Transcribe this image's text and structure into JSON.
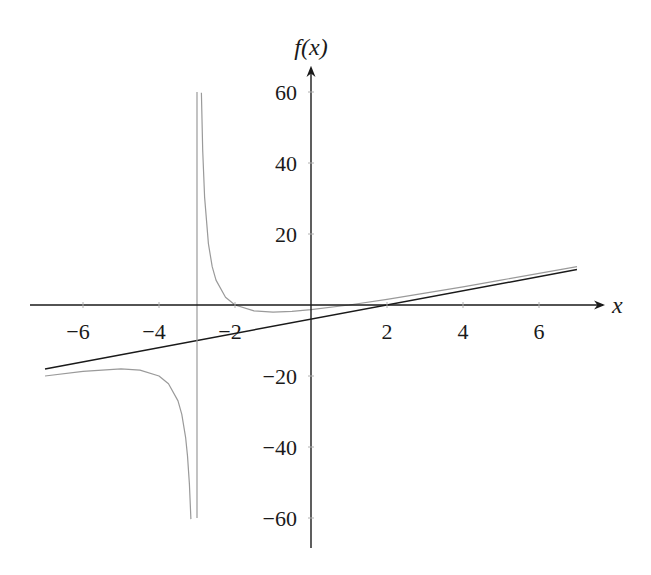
{
  "chart_data": {
    "type": "line",
    "title": "",
    "xlabel": "x",
    "ylabel": "f(x)",
    "xlim": [
      -7.5,
      7.8
    ],
    "ylim": [
      -68,
      67
    ],
    "x_ticks": [
      -6,
      -4,
      -2,
      2,
      4,
      6
    ],
    "x_tick_labels": [
      "−6",
      "−4",
      "−2",
      "2",
      "4",
      "6"
    ],
    "y_ticks": [
      60,
      40,
      20,
      -20,
      -40,
      -60
    ],
    "y_tick_labels": [
      "60",
      "40",
      "20",
      "−20",
      "−40",
      "−60"
    ],
    "grid": false,
    "legend": null,
    "series": [
      {
        "name": "f(x) = (2x^2 + 2x - 4)/(x + 3)",
        "color": "#9a9a9a",
        "branches": [
          {
            "x": [
              -7,
              -6,
              -5,
              -4.5,
              -4,
              -3.75,
              -3.5,
              -3.4,
              -3.3,
              -3.25,
              -3.2,
              -3.16
            ],
            "y": [
              -20,
              -18.67,
              -18,
              -18.33,
              -20,
              -22.17,
              -27,
              -30.8,
              -37.27,
              -42.5,
              -50.4,
              -60.3
            ]
          },
          {
            "x": [
              -2.885,
              -2.85,
              -2.8,
              -2.7,
              -2.6,
              -2.5,
              -2.25,
              -2,
              -1.5,
              -1,
              -0.5,
              0,
              1,
              2,
              3,
              4,
              5,
              6,
              7
            ],
            "y": [
              59.8,
              43.6,
              30.4,
              17.3,
              10.8,
              7,
              2.17,
              0,
              -1.67,
              -2,
              -1.8,
              -1.33,
              0,
              1.6,
              3.33,
              5.14,
              7,
              8.89,
              10.8
            ]
          }
        ]
      },
      {
        "name": "slant asymptote y = 2x - 4",
        "color": "#1a1a1a",
        "branches": [
          {
            "x": [
              -7,
              7
            ],
            "y": [
              -18,
              10
            ]
          }
        ]
      },
      {
        "name": "vertical asymptote x = -3",
        "color": "#9a9a9a",
        "branches": [
          {
            "x": [
              -3,
              -3
            ],
            "y": [
              60,
              -60
            ]
          }
        ]
      }
    ]
  },
  "layout": {
    "origin_px": [
      311,
      305
    ],
    "x_scale_px": 38,
    "y_scale_px": 3.55,
    "x_axis_px": [
      30,
      603
    ],
    "y_axis_px": [
      548,
      68
    ]
  }
}
